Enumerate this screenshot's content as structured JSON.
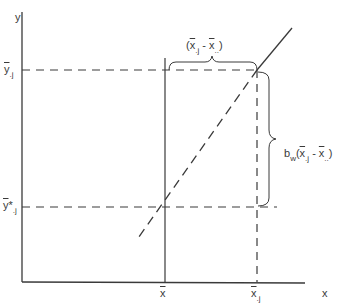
{
  "diagram": {
    "axes": {
      "x_label": "x",
      "y_label": "y"
    },
    "x_ticks": {
      "grand_mean": {
        "base": "x",
        "sub": ""
      },
      "group_mean": {
        "base": "x",
        "sub": ".j"
      }
    },
    "y_ticks": {
      "group_mean": {
        "base": "y",
        "sub": ".j"
      },
      "adjusted_mean": {
        "base": "y",
        "star": "*",
        "sub": ".j"
      }
    },
    "annotations": {
      "horizontal_brace": {
        "open": "(",
        "a": "x",
        "a_sub": ".j",
        "minus": " - ",
        "b": "x",
        "b_sub": "..",
        "close": ")"
      },
      "vertical_brace": {
        "coef": "b",
        "coef_sub": "w",
        "open": "(",
        "a": "x",
        "a_sub": ".j",
        "minus": " - ",
        "b": "x",
        "b_sub": "..",
        "close": ")"
      }
    },
    "colors": {
      "line": "#3a3a3a",
      "background": "#ffffff"
    }
  }
}
